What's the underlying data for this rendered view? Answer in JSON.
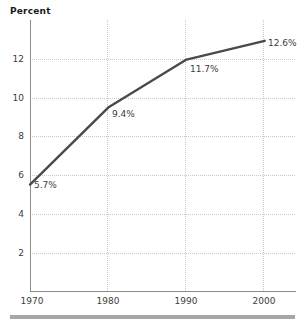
{
  "chart_data": {
    "type": "line",
    "title": "Percent",
    "xlabel": "",
    "ylabel": "Percent",
    "x": [
      1970,
      1980,
      1990,
      2000
    ],
    "values": [
      5.7,
      9.4,
      11.7,
      12.6
    ],
    "point_labels": [
      "5.7%",
      "9.4%",
      "11.7%",
      "12.6%"
    ],
    "xticks": [
      "1970",
      "1980",
      "1990",
      "2000"
    ],
    "yticks": [
      "2",
      "4",
      "6",
      "8",
      "10",
      "12"
    ],
    "ytick_values": [
      2,
      4,
      6,
      8,
      10,
      12
    ],
    "ylim": [
      0.6,
      13.6
    ],
    "xlim": [
      1970,
      2004
    ],
    "grid": true,
    "legend": "none",
    "series": [
      {
        "name": "Percent",
        "values": [
          5.7,
          9.4,
          11.7,
          12.6
        ]
      }
    ]
  },
  "colors": {
    "line": "#4a4a4a",
    "grid": "#c9c9c9",
    "axis": "#8c8c8c",
    "text": "#3d3d3d",
    "title": "#1a1a1a",
    "rule": "#a6a6a6",
    "background": "#ffffff"
  },
  "axis": {
    "title": "Percent"
  },
  "ticks": {
    "y": [
      {
        "label": "12"
      },
      {
        "label": "10"
      },
      {
        "label": "8"
      },
      {
        "label": "6"
      },
      {
        "label": "4"
      },
      {
        "label": "2"
      }
    ],
    "x": [
      {
        "label": "1970"
      },
      {
        "label": "1980"
      },
      {
        "label": "1990"
      },
      {
        "label": "2000"
      }
    ]
  },
  "labels": {
    "p0": "5.7%",
    "p1": "9.4%",
    "p2": "11.7%",
    "p3": "12.6%"
  }
}
